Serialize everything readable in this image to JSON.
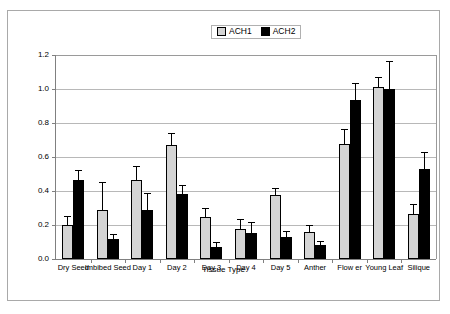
{
  "chart_data": {
    "type": "bar",
    "title": "",
    "xlabel": "Tissue Type",
    "ylabel": "Relative Expression",
    "ylim": [
      0,
      1.2
    ],
    "ytick_values": [
      0.0,
      0.2,
      0.4,
      0.6,
      0.8,
      1.0,
      1.2
    ],
    "ytick_labels": [
      "0.0",
      "0.2",
      "0.4",
      "0.6",
      "0.8",
      "1.0",
      "1.2"
    ],
    "grid": true,
    "legend_position": "top-center",
    "categories": [
      "Dry Seed",
      "Imbibed Seed",
      "Day 1",
      "Day 2",
      "Day 3",
      "Day 4",
      "Day 5",
      "Anther",
      "Flow er",
      "Young Leaf",
      "Silique"
    ],
    "series": [
      {
        "name": "ACH1",
        "color": "#d4d4d4",
        "values": [
          0.2,
          0.29,
          0.465,
          0.67,
          0.25,
          0.175,
          0.375,
          0.16,
          0.675,
          1.01,
          0.265
        ],
        "errors": [
          0.045,
          0.155,
          0.075,
          0.065,
          0.045,
          0.055,
          0.035,
          0.035,
          0.085,
          0.055,
          0.055
        ]
      },
      {
        "name": "ACH2",
        "color": "#000000",
        "values": [
          0.465,
          0.115,
          0.29,
          0.385,
          0.07,
          0.155,
          0.13,
          0.08,
          0.935,
          1.0,
          0.53
        ],
        "errors": [
          0.055,
          0.025,
          0.095,
          0.045,
          0.025,
          0.055,
          0.03,
          0.02,
          0.095,
          0.16,
          0.095
        ]
      }
    ]
  },
  "legend": {
    "items": [
      {
        "label": "ACH1",
        "swatch": "ach1"
      },
      {
        "label": "ACH2",
        "swatch": "ach2"
      }
    ]
  }
}
